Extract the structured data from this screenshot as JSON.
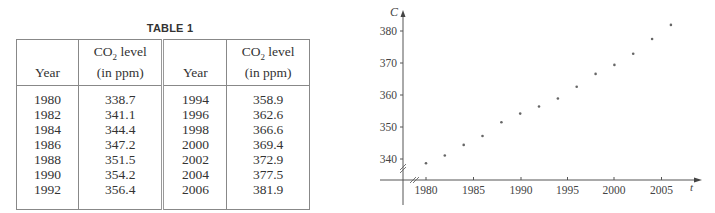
{
  "table": {
    "title": "TABLE 1",
    "headers": {
      "year": "Year",
      "co2_line1": "CO",
      "co2_sub": "2",
      "co2_line1_suffix": " level",
      "co2_line2": "(in ppm)"
    },
    "rows": [
      {
        "year_a": "1980",
        "co2_a": "338.7",
        "year_b": "1994",
        "co2_b": "358.9"
      },
      {
        "year_a": "1982",
        "co2_a": "341.1",
        "year_b": "1996",
        "co2_b": "362.6"
      },
      {
        "year_a": "1984",
        "co2_a": "344.4",
        "year_b": "1998",
        "co2_b": "366.6"
      },
      {
        "year_a": "1986",
        "co2_a": "347.2",
        "year_b": "2000",
        "co2_b": "369.4"
      },
      {
        "year_a": "1988",
        "co2_a": "351.5",
        "year_b": "2002",
        "co2_b": "372.9"
      },
      {
        "year_a": "1990",
        "co2_a": "354.2",
        "year_b": "2004",
        "co2_b": "377.5"
      },
      {
        "year_a": "1992",
        "co2_a": "356.4",
        "year_b": "2006",
        "co2_b": "381.9"
      }
    ]
  },
  "chart_data": {
    "type": "scatter",
    "title": "",
    "xlabel": "t",
    "ylabel": "C",
    "x": [
      1980,
      1982,
      1984,
      1986,
      1988,
      1990,
      1992,
      1994,
      1996,
      1998,
      2000,
      2002,
      2004,
      2006
    ],
    "y": [
      338.7,
      341.1,
      344.4,
      347.2,
      351.5,
      354.2,
      356.4,
      358.9,
      362.6,
      366.6,
      369.4,
      372.9,
      377.5,
      381.9
    ],
    "x_ticks": [
      "1980",
      "1985",
      "1990",
      "1995",
      "2000",
      "2005"
    ],
    "y_ticks": [
      "340",
      "350",
      "360",
      "370",
      "380"
    ],
    "xlim": [
      1978,
      2008
    ],
    "ylim": [
      335,
      385
    ],
    "axis_breaks": true,
    "grid": false,
    "legend": null
  }
}
